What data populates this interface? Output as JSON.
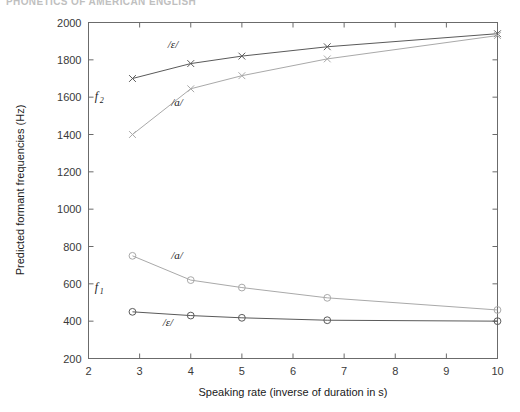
{
  "page": {
    "running_header": "PHONETICS OF AMERICAN ENGLISH"
  },
  "chart_data": {
    "type": "line",
    "title": "",
    "xlabel": "Speaking rate (inverse of duration in s)",
    "ylabel": "Predicted formant frequencies (Hz)",
    "xlim": [
      2,
      10
    ],
    "ylim": [
      200,
      2000
    ],
    "xticks": [
      2,
      3,
      4,
      5,
      6,
      7,
      8,
      9,
      10
    ],
    "yticks": [
      200,
      400,
      600,
      800,
      1000,
      1200,
      1400,
      1600,
      1800,
      2000
    ],
    "grid": false,
    "legend": "inline-annotations",
    "x": [
      2.86,
      4,
      5,
      6.67,
      10
    ],
    "series": [
      {
        "name": "F2 /ɛ/",
        "formant": "f2",
        "vowel": "/ɛ/",
        "marker": "x",
        "color": "#5a5a5a",
        "values": [
          1700,
          1780,
          1820,
          1870,
          1940
        ]
      },
      {
        "name": "F2 /a/",
        "formant": "f2",
        "vowel": "/a/",
        "marker": "x",
        "color": "#a9a9a9",
        "values": [
          1400,
          1645,
          1715,
          1805,
          1930
        ]
      },
      {
        "name": "F1 /a/",
        "formant": "f1",
        "vowel": "/a/",
        "marker": "o",
        "color": "#a9a9a9",
        "values": [
          750,
          620,
          580,
          525,
          460
        ]
      },
      {
        "name": "F1 /ɛ/",
        "formant": "f1",
        "vowel": "/ɛ/",
        "marker": "o",
        "color": "#5a5a5a",
        "values": [
          450,
          430,
          418,
          405,
          400
        ]
      }
    ],
    "annotations": [
      {
        "id": "f2-eps",
        "text": "/ɛ/",
        "x": 3.55,
        "y": 1865
      },
      {
        "id": "f2-a",
        "text": "/a/",
        "x": 3.62,
        "y": 1555
      },
      {
        "id": "f1-a",
        "text": "/a/",
        "x": 3.62,
        "y": 735
      },
      {
        "id": "f1-eps",
        "text": "/ɛ/",
        "x": 3.45,
        "y": 372
      },
      {
        "id": "f2-tag",
        "base": "f",
        "sub": "2",
        "x": 2.12,
        "y": 1585
      },
      {
        "id": "f1-tag",
        "base": "f",
        "sub": "1",
        "x": 2.12,
        "y": 562
      }
    ]
  }
}
